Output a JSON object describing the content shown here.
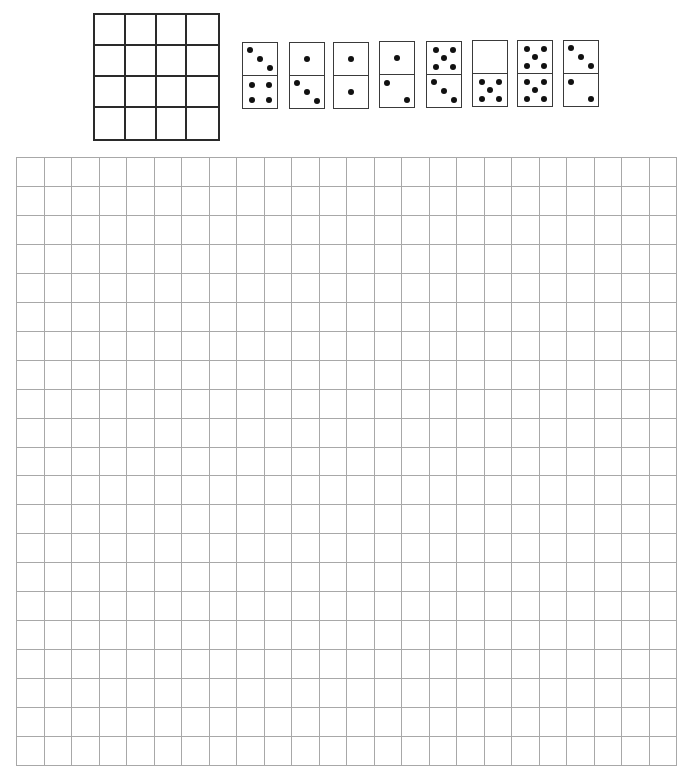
{
  "puzzle": {
    "target_grid": {
      "rows": 4,
      "cols": 4
    },
    "board": {
      "rows": 21,
      "cols": 24,
      "line_color": "#a8a8a8"
    },
    "dominoes": [
      {
        "id": 1,
        "x": 242,
        "y": 42,
        "top": 3,
        "bottom": 4
      },
      {
        "id": 2,
        "x": 289,
        "y": 42,
        "top": 1,
        "bottom": 3
      },
      {
        "id": 3,
        "x": 333,
        "y": 42,
        "top": 1,
        "bottom": 1
      },
      {
        "id": 4,
        "x": 379,
        "y": 41,
        "top": 1,
        "bottom": 2
      },
      {
        "id": 5,
        "x": 426,
        "y": 41,
        "top": 5,
        "bottom": 3
      },
      {
        "id": 6,
        "x": 472,
        "y": 40,
        "top": 0,
        "bottom": 5
      },
      {
        "id": 7,
        "x": 517,
        "y": 40,
        "top": 5,
        "bottom": 5
      },
      {
        "id": 8,
        "x": 563,
        "y": 40,
        "top": 3,
        "bottom": 2
      }
    ]
  }
}
